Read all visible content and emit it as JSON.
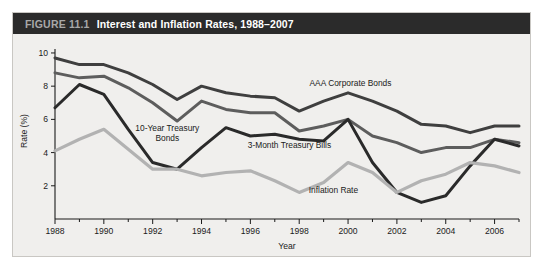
{
  "figure": {
    "number_label": "FIGURE 11.1",
    "title": "Interest and Inflation Rates, 1988–2007"
  },
  "chart_data": {
    "type": "line",
    "title": "Interest and Inflation Rates, 1988–2007",
    "xlabel": "Year",
    "ylabel": "Rate (%)",
    "xlim": [
      1988,
      2007
    ],
    "ylim": [
      0,
      10.6
    ],
    "yticks": [
      2,
      4,
      6,
      8,
      10
    ],
    "ytick_labels": [
      "2",
      "4",
      "6",
      "8",
      "10"
    ],
    "xticks": [
      1988,
      1990,
      1992,
      1994,
      1996,
      1998,
      2000,
      2002,
      2004,
      2006
    ],
    "xtick_labels": [
      "1988",
      "1990",
      "1992",
      "1994",
      "1996",
      "1998",
      "2000",
      "2002",
      "2004",
      "2006"
    ],
    "x_minor_ticks": [
      1989,
      1991,
      1993,
      1995,
      1997,
      1999,
      2001,
      2003,
      2005,
      2007
    ],
    "grid": false,
    "legend_position": "inline-annotations",
    "x": [
      1988,
      1989,
      1990,
      1991,
      1992,
      1993,
      1994,
      1995,
      1996,
      1997,
      1998,
      1999,
      2000,
      2001,
      2002,
      2003,
      2004,
      2005,
      2006,
      2007
    ],
    "series": [
      {
        "name": "AAA Corporate Bonds",
        "color": "#3f3f3f",
        "label_x": 2000.1,
        "label_y": 8.0,
        "values": [
          9.7,
          9.3,
          9.3,
          8.8,
          8.1,
          7.2,
          8.0,
          7.6,
          7.4,
          7.3,
          6.5,
          7.1,
          7.6,
          7.1,
          6.5,
          5.7,
          5.6,
          5.2,
          5.6,
          5.6
        ]
      },
      {
        "name": "10-Year Treasury Bonds",
        "color": "#5d5d5d",
        "label_x": 1992.6,
        "label_y": 5.3,
        "values": [
          8.8,
          8.5,
          8.6,
          7.9,
          7.0,
          5.9,
          7.1,
          6.6,
          6.4,
          6.4,
          5.3,
          5.6,
          6.0,
          5.0,
          4.6,
          4.0,
          4.3,
          4.3,
          4.8,
          4.6
        ]
      },
      {
        "name": "3-Month Treasury Bills",
        "color": "#2a2a2a",
        "label_x": 1997.6,
        "label_y": 4.3,
        "values": [
          6.7,
          8.1,
          7.5,
          5.4,
          3.4,
          3.0,
          4.3,
          5.5,
          5.0,
          5.1,
          4.8,
          4.7,
          6.0,
          3.4,
          1.6,
          1.0,
          1.4,
          3.2,
          4.8,
          4.4
        ]
      },
      {
        "name": "Inflation Rate",
        "color": "#b2b2b2",
        "label_x": 1999.4,
        "label_y": 1.55,
        "values": [
          4.1,
          4.8,
          5.4,
          4.2,
          3.0,
          3.0,
          2.6,
          2.8,
          2.9,
          2.3,
          1.6,
          2.2,
          3.4,
          2.8,
          1.6,
          2.3,
          2.7,
          3.4,
          3.2,
          2.8
        ]
      }
    ]
  }
}
